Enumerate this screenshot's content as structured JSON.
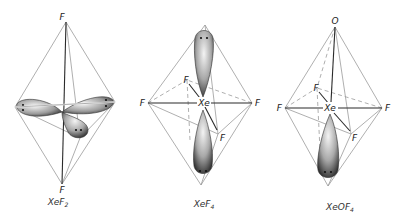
{
  "figures": [
    {
      "id": "xef2",
      "caption": "XeF",
      "caption_sub": "2",
      "atoms": {
        "top": "F",
        "bottom": "F"
      },
      "lone_pairs": 3,
      "geometry": "trigonal bipyramidal (linear molecule)"
    },
    {
      "id": "xef4",
      "caption": "XeF",
      "caption_sub": "4",
      "atoms": {
        "center": "Xe",
        "left": "F",
        "right": "F",
        "back": "F",
        "front": "F"
      },
      "lone_pairs": 2,
      "geometry": "octahedral (square planar molecule)"
    },
    {
      "id": "xeof4",
      "caption": "XeOF",
      "caption_sub": "4",
      "atoms": {
        "top": "O",
        "center": "Xe",
        "left": "F",
        "right": "F",
        "back": "F",
        "front": "F"
      },
      "lone_pairs": 1,
      "geometry": "octahedral (square pyramidal molecule)"
    }
  ],
  "colors": {
    "edge": "#9a9a9a",
    "bond": "#2a2a2a",
    "lobe_fill": "#bdbdbd",
    "lobe_dark": "#3a3a3a"
  }
}
